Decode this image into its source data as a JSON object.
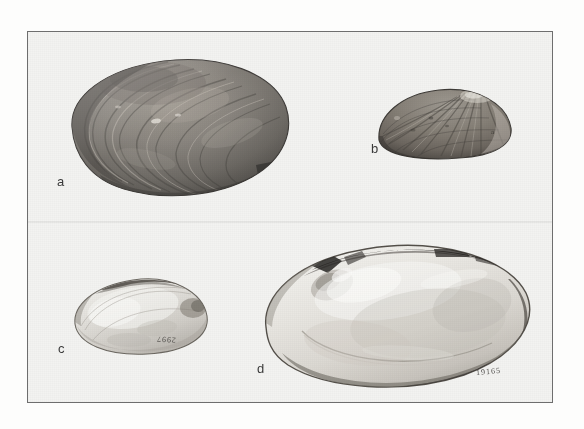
{
  "figure": {
    "kind": "specimen-plate",
    "background_color": "#fdfdfc",
    "field_color": "#f3f3f1",
    "frame_color": "#6e6e6e"
  },
  "labels": {
    "a": "a",
    "b": "b",
    "c": "c",
    "d": "d"
  },
  "specimens": [
    {
      "id": "a",
      "label": "a",
      "view": "exterior left valve",
      "surface": "concentric growth rings",
      "tone": "dark brown-grey",
      "catalog_number": ""
    },
    {
      "id": "b",
      "label": "b",
      "view": "exterior valve",
      "surface": "radial ribbing with concentric growth lines",
      "tone": "medium grey",
      "catalog_number": ""
    },
    {
      "id": "c",
      "label": "c",
      "view": "exterior valve",
      "surface": "smooth, pale",
      "tone": "light grey",
      "catalog_number": "2997"
    },
    {
      "id": "d",
      "label": "d",
      "view": "interior valve showing nacre and pallial line",
      "surface": "smooth nacreous interior",
      "tone": "pale cream-grey",
      "catalog_number": "19165"
    }
  ]
}
